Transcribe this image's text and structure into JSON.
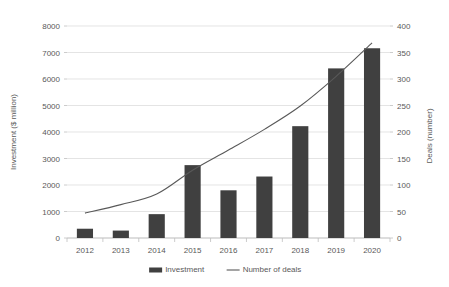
{
  "chart_data": {
    "type": "bar",
    "title": "",
    "subtitle": "",
    "categories": [
      "2012",
      "2013",
      "2014",
      "2015",
      "2016",
      "2017",
      "2018",
      "2019",
      "2020"
    ],
    "xlabel": "",
    "ylabel": "Investment ($ million)",
    "y2label": "Deals (number)",
    "ylim": [
      0,
      8000
    ],
    "y2lim": [
      0,
      400
    ],
    "yticks": [
      "0",
      "1000",
      "2000",
      "3000",
      "4000",
      "5000",
      "6000",
      "7000",
      "8000"
    ],
    "ytick_values": [
      0,
      1000,
      2000,
      3000,
      4000,
      5000,
      6000,
      7000,
      8000
    ],
    "y2ticks": [
      "0",
      "50",
      "100",
      "150",
      "200",
      "250",
      "300",
      "350",
      "400"
    ],
    "y2tick_values": [
      0,
      50,
      100,
      150,
      200,
      250,
      300,
      350,
      400
    ],
    "grid": true,
    "legend_position": "bottom",
    "series": [
      {
        "name": "Investment",
        "type": "bar",
        "axis": "left",
        "color": "#404040",
        "values": [
          350,
          280,
          900,
          2750,
          1800,
          2320,
          4220,
          6400,
          7160
        ]
      },
      {
        "name": "Number of deals",
        "type": "line",
        "axis": "right",
        "color": "#595959",
        "values": [
          47,
          63,
          83,
          128,
          166,
          205,
          249,
          305,
          368
        ]
      }
    ],
    "legend": [
      "Investment",
      "Number of deals"
    ]
  }
}
